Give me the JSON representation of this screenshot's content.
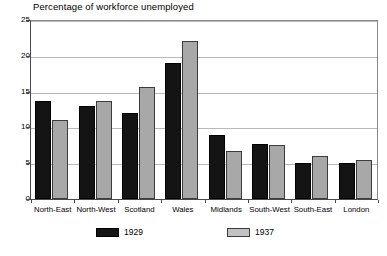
{
  "chart_data": {
    "type": "bar",
    "title": "Percentage of workforce unemployed",
    "xlabel": "",
    "ylabel": "",
    "ylim": [
      0,
      25
    ],
    "yticks": [
      0,
      5,
      10,
      15,
      20,
      25
    ],
    "ytick_labels": [
      "0",
      "5",
      "10",
      "15",
      "20",
      "25"
    ],
    "grid": true,
    "legend_position": "bottom",
    "categories": [
      "North-East",
      "North-West",
      "Scotland",
      "Wales",
      "Midlands",
      "South-West",
      "South-East",
      "London"
    ],
    "series": [
      {
        "name": "1929",
        "color": "#141414",
        "values": [
          13.7,
          13.0,
          12.0,
          19.0,
          9.0,
          7.7,
          5.0,
          5.0
        ]
      },
      {
        "name": "1937",
        "color": "#a8a8a8",
        "values": [
          11.0,
          13.7,
          15.6,
          22.0,
          6.7,
          7.5,
          6.0,
          5.5
        ]
      }
    ]
  },
  "legend": {
    "items": [
      {
        "label": "1929"
      },
      {
        "label": "1937"
      }
    ]
  }
}
